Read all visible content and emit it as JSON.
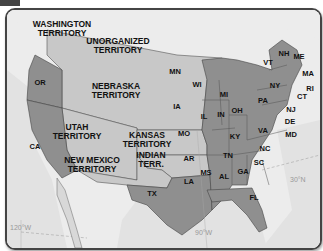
{
  "map": {
    "colors": {
      "state": "#8f8f8f",
      "territory": "#c8c8c8",
      "foreign_land": "#ececec",
      "water": "#e0e0e0",
      "border": "#444444"
    },
    "territories": [
      {
        "id": "washington",
        "label": "WASHINGTON\nTERRITORY"
      },
      {
        "id": "unorganized",
        "label": "UNORGANIZED\nTERRITORY"
      },
      {
        "id": "nebraska",
        "label": "NEBRASKA\nTERRITORY"
      },
      {
        "id": "utah",
        "label": "UTAH\nTERRITORY"
      },
      {
        "id": "kansas",
        "label": "KANSAS\nTERRITORY"
      },
      {
        "id": "new_mexico",
        "label": "NEW MEXICO\nTERRITORY"
      },
      {
        "id": "indian",
        "label": "INDIAN\nTERR."
      }
    ],
    "states": [
      "OR",
      "CA",
      "TX",
      "MN",
      "IA",
      "WI",
      "MI",
      "IL",
      "IN",
      "OH",
      "MO",
      "AR",
      "LA",
      "MS",
      "AL",
      "TN",
      "KY",
      "GA",
      "FL",
      "SC",
      "NC",
      "VA",
      "MD",
      "DE",
      "NJ",
      "PA",
      "NY",
      "CT",
      "RI",
      "MA",
      "VT",
      "NH",
      "ME"
    ],
    "coordinates": {
      "lat_30": "30°N",
      "lon_90": "90°W",
      "lon_120": "120°W"
    }
  }
}
